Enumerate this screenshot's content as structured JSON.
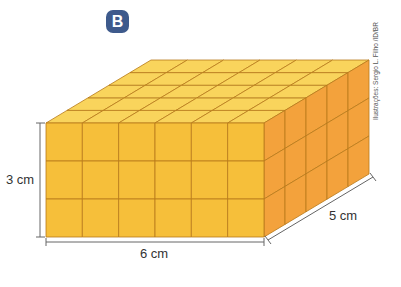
{
  "figure": {
    "badge_label": "B",
    "badge_color": "#3e5a8c",
    "credit": "Ilustrações: Sergio L. Filho /ID/BR",
    "dimensions": {
      "height_label": "3 cm",
      "width_label": "6 cm",
      "depth_label": "5 cm"
    },
    "block": {
      "width_units": 6,
      "height_units": 3,
      "depth_units": 5,
      "colors": {
        "front": "#f6bf3a",
        "top": "#f9d45c",
        "side": "#f3a23c",
        "grid_line": "#b87a1a"
      }
    }
  }
}
